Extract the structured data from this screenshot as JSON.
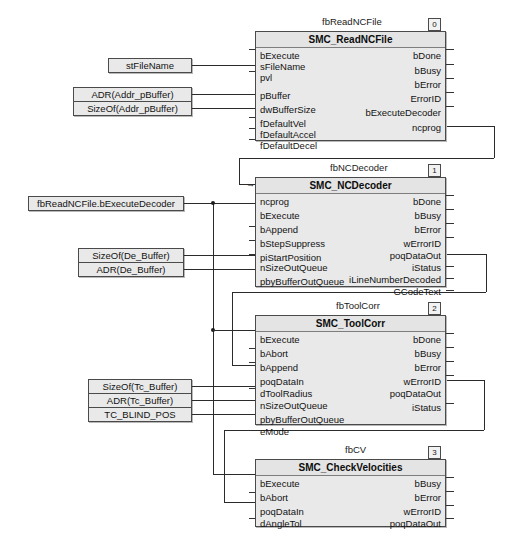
{
  "diagram": {
    "type": "function-block-diagram",
    "language": "CFC / FBD",
    "blocks": [
      {
        "id": "fb0",
        "badge": "0",
        "instance_name": "fbReadNCFile",
        "type_name": "SMC_ReadNCFile",
        "inputs": [
          "bExecute",
          "sFileName",
          "pvl",
          "pBuffer",
          "dwBufferSize",
          "fDefaultVel",
          "fDefaultAccel",
          "fDefaultDecel"
        ],
        "outputs": [
          "bDone",
          "bBusy",
          "bError",
          "ErrorID",
          "bExecuteDecoder",
          "ncprog"
        ]
      },
      {
        "id": "fb1",
        "badge": "1",
        "instance_name": "fbNCDecoder",
        "type_name": "SMC_NCDecoder",
        "inputs": [
          "ncprog",
          "bExecute",
          "bAppend",
          "bStepSuppress",
          "piStartPosition",
          "nSizeOutQueue",
          "pbyBufferOutQueue"
        ],
        "outputs": [
          "bDone",
          "bBusy",
          "bError",
          "wErrorID",
          "poqDataOut",
          "iStatus",
          "iLineNumberDecoded",
          "GCodeText"
        ]
      },
      {
        "id": "fb2",
        "badge": "2",
        "instance_name": "fbToolCorr",
        "type_name": "SMC_ToolCorr",
        "inputs": [
          "bExecute",
          "bAbort",
          "bAppend",
          "poqDataIn",
          "dToolRadius",
          "nSizeOutQueue",
          "pbyBufferOutQueue",
          "eMode"
        ],
        "outputs": [
          "bDone",
          "bBusy",
          "bError",
          "wErrorID",
          "poqDataOut",
          "iStatus"
        ]
      },
      {
        "id": "fb3",
        "badge": "3",
        "instance_name": "fbCV",
        "type_name": "SMC_CheckVelocities",
        "inputs": [
          "bExecute",
          "bAbort",
          "poqDataIn",
          "dAngleTol"
        ],
        "outputs": [
          "bBusy",
          "bError",
          "wErrorID",
          "poqDataOut"
        ]
      }
    ],
    "variables": [
      {
        "id": "v0",
        "label": "stFileName"
      },
      {
        "id": "v1",
        "label": "ADR(Addr_pBuffer)"
      },
      {
        "id": "v2",
        "label": "SizeOf(Addr_pBuffer)"
      },
      {
        "id": "v3",
        "label": "fbReadNCFile.bExecuteDecoder"
      },
      {
        "id": "v4",
        "label": "SizeOf(De_Buffer)"
      },
      {
        "id": "v5",
        "label": "ADR(De_Buffer)"
      },
      {
        "id": "v6",
        "label": "SizeOf(Tc_Buffer)"
      },
      {
        "id": "v7",
        "label": "ADR(Tc_Buffer)"
      },
      {
        "id": "v8",
        "label": "TC_BLIND_POS"
      }
    ],
    "colors": {
      "block_fill": "#e9e9e9",
      "block_border": "#4a4a4a",
      "wire": "#2b2b2b",
      "background": "#ffffff"
    }
  }
}
